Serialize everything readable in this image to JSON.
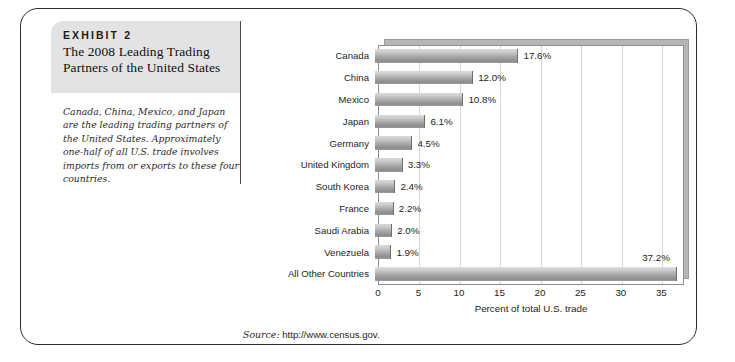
{
  "exhibit": {
    "label": "EXHIBIT 2",
    "title": "The 2008 Leading Trading Partners of the United States",
    "caption": "Canada, China, Mexico, and Japan are the leading trading partners of the United States. Approximately one-half of all U.S. trade involves imports from or exports to these four countries."
  },
  "source": {
    "prefix": "Source:",
    "url": "http://www.census.gov."
  },
  "colors": {
    "frame_border": "#2b2b2b",
    "header_bg": "#e3e3e3",
    "bar_light": "#d8d8d8",
    "bar_dark": "#8d8d8d",
    "gridline": "#d8d8d8",
    "plot_border": "#8e8e8e"
  },
  "chart_data": {
    "type": "bar",
    "orientation": "horizontal",
    "title": "",
    "xlabel": "Percent of total U.S. trade",
    "ylabel": "",
    "xlim": [
      0,
      37.8
    ],
    "xticks": [
      0,
      5,
      10,
      15,
      20,
      25,
      30,
      35
    ],
    "xtick_labels": [
      "0",
      "5",
      "10",
      "15",
      "20",
      "25",
      "30",
      "35"
    ],
    "grid": "vertical",
    "legend": "none",
    "categories": [
      "Canada",
      "China",
      "Mexico",
      "Japan",
      "Germany",
      "United Kingdom",
      "South Korea",
      "France",
      "Saudi Arabia",
      "Venezuela",
      "All Other Countries"
    ],
    "values": [
      17.6,
      12.0,
      10.8,
      6.1,
      4.5,
      3.3,
      2.4,
      2.2,
      2.0,
      1.9,
      37.2
    ],
    "data_labels": [
      "17.6%",
      "12.0%",
      "10.8%",
      "6.1%",
      "4.5%",
      "3.3%",
      "2.4%",
      "2.2%",
      "2.0%",
      "1.9%",
      "37.2%"
    ]
  }
}
